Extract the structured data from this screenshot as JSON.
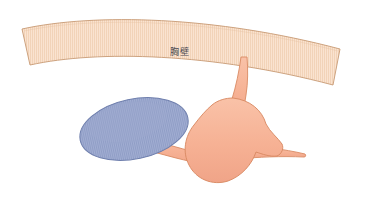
{
  "figure": {
    "kind": "medical-anatomical-illustration",
    "background_color": "#FFFFFF",
    "width": 384,
    "height": 203
  },
  "labels": {
    "chest_wall": "胸壁"
  },
  "structures": {
    "chest_wall": {
      "name": "chest-wall-band",
      "label": "胸壁",
      "fill_color": "#FAE3D0",
      "stroke_color": "#C79A74",
      "texture": "vertical-stripes",
      "texture_color": "#F2D2B8"
    },
    "effusion": {
      "name": "blue-ellipse",
      "fill_color": "#909EC6",
      "stroke_color": "#6F7FAD",
      "texture": "vertical-stripes",
      "texture_color": "#A3AFD0"
    },
    "vessel": {
      "name": "salmon-branching-structure",
      "fill_color": "#F6B194",
      "stroke_color": "#D98A63",
      "texture": "none",
      "branches": [
        "superior-stalk",
        "left-tapering-tail",
        "right-tapering-branch"
      ]
    }
  },
  "palette": {
    "chest_wall_fill": "#FAE3D0",
    "chest_wall_stroke": "#C79A74",
    "effusion_fill": "#909EC6",
    "effusion_stroke": "#6F7FAD",
    "vessel_fill": "#F6B194",
    "vessel_stroke": "#D98A63",
    "label_color": "#4A4A52",
    "background": "#FFFFFF"
  }
}
